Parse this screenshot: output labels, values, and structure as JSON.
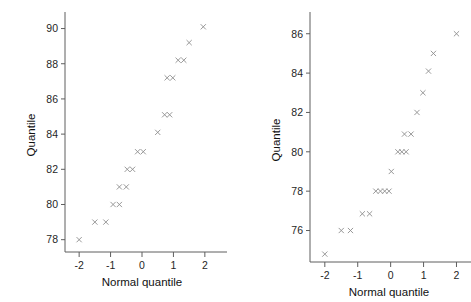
{
  "figure": {
    "background": "#ffffff",
    "marker_color": "#8d8d8d",
    "axis_color": "#5e5e5e",
    "text_color": "#1a1a1a",
    "marker_glyph": "x"
  },
  "chart_data": [
    {
      "type": "scatter",
      "panel": "left",
      "title": "",
      "xlabel": "Normal quantile",
      "ylabel": "Quantile",
      "xlim": [
        -2.45,
        2.45
      ],
      "ylim": [
        77.3,
        90.6
      ],
      "xticks": [
        -2,
        -1,
        0,
        1,
        2
      ],
      "xticklabels": [
        "-2",
        "-1",
        "0",
        "1",
        "2"
      ],
      "yticks": [
        78,
        80,
        82,
        84,
        86,
        88,
        90
      ],
      "yticklabels": [
        "78",
        "80",
        "82",
        "84",
        "86",
        "88",
        "90"
      ],
      "grid": false,
      "legend": false,
      "marker": "x",
      "x": [
        -2.0,
        -1.5,
        -1.15,
        -0.92,
        -0.72,
        -0.72,
        -0.5,
        -0.47,
        -0.35,
        -0.15,
        0.05,
        0.5,
        0.72,
        0.85,
        0.8,
        0.95,
        1.15,
        1.3,
        1.5,
        1.95
      ],
      "y": [
        78,
        79,
        79,
        80,
        80,
        81,
        81,
        82,
        82,
        83,
        83,
        84,
        85,
        85,
        87.2,
        87.2,
        88.2,
        88.2,
        89.2,
        90.1
      ],
      "points": [
        {
          "x": -2.0,
          "y": 78.0
        },
        {
          "x": -1.5,
          "y": 79.0
        },
        {
          "x": -1.15,
          "y": 79.0
        },
        {
          "x": -0.92,
          "y": 80.0
        },
        {
          "x": -0.72,
          "y": 80.0
        },
        {
          "x": -0.72,
          "y": 81.0
        },
        {
          "x": -0.5,
          "y": 81.0
        },
        {
          "x": -0.47,
          "y": 82.0
        },
        {
          "x": -0.3,
          "y": 82.0
        },
        {
          "x": -0.14,
          "y": 83.0
        },
        {
          "x": 0.04,
          "y": 83.0
        },
        {
          "x": 0.5,
          "y": 84.1
        },
        {
          "x": 0.72,
          "y": 85.1
        },
        {
          "x": 0.88,
          "y": 85.1
        },
        {
          "x": 0.8,
          "y": 87.2
        },
        {
          "x": 0.98,
          "y": 87.2
        },
        {
          "x": 1.15,
          "y": 88.2
        },
        {
          "x": 1.33,
          "y": 88.2
        },
        {
          "x": 1.5,
          "y": 89.2
        },
        {
          "x": 1.95,
          "y": 90.1
        }
      ]
    },
    {
      "type": "scatter",
      "panel": "right",
      "title": "",
      "xlabel": "Normal quantile",
      "ylabel": "Quantile",
      "xlim": [
        -2.45,
        2.35
      ],
      "ylim": [
        74.4,
        86.8
      ],
      "xticks": [
        -2,
        -1,
        0,
        1,
        2
      ],
      "xticklabels": [
        "-2",
        "-1",
        "0",
        "1",
        "2"
      ],
      "yticks": [
        76,
        78,
        80,
        82,
        84,
        86
      ],
      "yticklabels": [
        "76",
        "78",
        "80",
        "82",
        "84",
        "86"
      ],
      "grid": false,
      "legend": false,
      "marker": "x",
      "x": [
        -2.0,
        -1.5,
        -1.2,
        -0.85,
        -0.62,
        -0.45,
        -0.3,
        -0.17,
        -0.05,
        0.0,
        0.22,
        0.37,
        0.5,
        0.42,
        0.62,
        0.8,
        0.98,
        1.15,
        1.3,
        2.0
      ],
      "y": [
        74.8,
        76.0,
        76.0,
        76.8,
        76.8,
        78.0,
        78.0,
        78.0,
        78.0,
        79.0,
        80.0,
        80.0,
        80.0,
        81.0,
        81.0,
        82.0,
        83.0,
        84.1,
        85.0,
        86.0
      ],
      "points": [
        {
          "x": -2.0,
          "y": 74.8
        },
        {
          "x": -1.5,
          "y": 76.0
        },
        {
          "x": -1.22,
          "y": 76.0
        },
        {
          "x": -0.86,
          "y": 76.85
        },
        {
          "x": -0.64,
          "y": 76.85
        },
        {
          "x": -0.45,
          "y": 78.0
        },
        {
          "x": -0.31,
          "y": 78.0
        },
        {
          "x": -0.18,
          "y": 78.0
        },
        {
          "x": -0.05,
          "y": 78.0
        },
        {
          "x": 0.02,
          "y": 79.0
        },
        {
          "x": 0.22,
          "y": 80.0
        },
        {
          "x": 0.34,
          "y": 80.0
        },
        {
          "x": 0.47,
          "y": 80.0
        },
        {
          "x": 0.42,
          "y": 80.9
        },
        {
          "x": 0.62,
          "y": 80.9
        },
        {
          "x": 0.8,
          "y": 82.0
        },
        {
          "x": 0.98,
          "y": 83.0
        },
        {
          "x": 1.15,
          "y": 84.1
        },
        {
          "x": 1.3,
          "y": 85.0
        },
        {
          "x": 2.0,
          "y": 86.0
        }
      ]
    }
  ]
}
